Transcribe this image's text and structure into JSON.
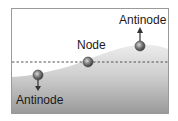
{
  "diagram": {
    "title": "",
    "labels": {
      "antinode_top": "Antinode",
      "node": "Node",
      "antinode_bottom": "Antinode"
    },
    "colors": {
      "frame": "#9a9a9a",
      "water_light": "#e4e4e4",
      "water_dark": "#9e9e9e",
      "dashed_line": "#555555",
      "ball": "#6a6a6a",
      "arrow": "#333333"
    },
    "elements": [
      {
        "type": "ball",
        "role": "antinode",
        "position": "bottom-left",
        "arrow": "down"
      },
      {
        "type": "ball",
        "role": "node",
        "position": "center",
        "arrow": "none"
      },
      {
        "type": "ball",
        "role": "antinode",
        "position": "top-right",
        "arrow": "up"
      }
    ]
  }
}
